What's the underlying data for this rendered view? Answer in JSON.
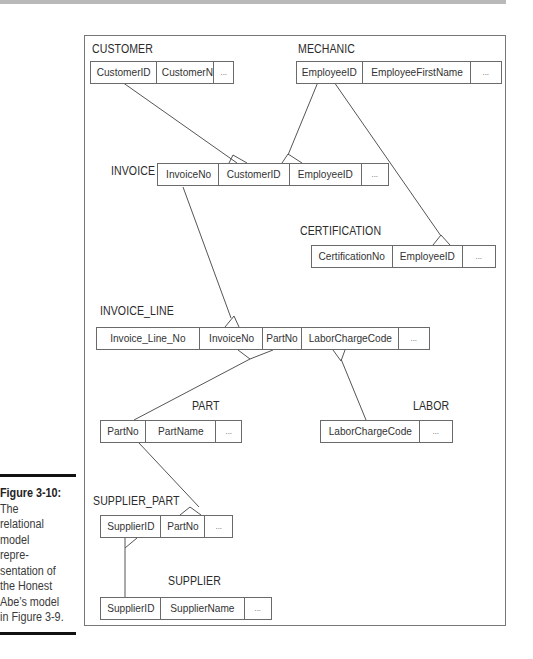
{
  "diagram": {
    "type": "relational-model",
    "tables": [
      {
        "name": "CUSTOMER",
        "columns": [
          "CustomerID",
          "CustomerName",
          "..."
        ]
      },
      {
        "name": "MECHANIC",
        "columns": [
          "EmployeeID",
          "EmployeeFirstName",
          "..."
        ]
      },
      {
        "name": "INVOICE",
        "columns": [
          "InvoiceNo",
          "CustomerID",
          "EmployeeID",
          "..."
        ]
      },
      {
        "name": "CERTIFICATION",
        "columns": [
          "CertificationNo",
          "EmployeeID",
          "..."
        ]
      },
      {
        "name": "INVOICE_LINE",
        "columns": [
          "Invoice_Line_No",
          "InvoiceNo",
          "PartNo",
          "LaborChargeCode",
          "..."
        ]
      },
      {
        "name": "PART",
        "columns": [
          "PartNo",
          "PartName",
          "..."
        ]
      },
      {
        "name": "LABOR",
        "columns": [
          "LaborChargeCode",
          "..."
        ]
      },
      {
        "name": "SUPPLIER_PART",
        "columns": [
          "SupplierID",
          "PartNo",
          "..."
        ]
      },
      {
        "name": "SUPPLIER",
        "columns": [
          "SupplierID",
          "SupplierName",
          "..."
        ]
      }
    ],
    "relationships": [
      {
        "from": "CUSTOMER.CustomerID",
        "to": "INVOICE.CustomerID",
        "cardinality": "one-to-many"
      },
      {
        "from": "MECHANIC.EmployeeID",
        "to": "INVOICE.EmployeeID",
        "cardinality": "one-to-many"
      },
      {
        "from": "MECHANIC.EmployeeID",
        "to": "CERTIFICATION.EmployeeID",
        "cardinality": "one-to-many"
      },
      {
        "from": "INVOICE.InvoiceNo",
        "to": "INVOICE_LINE.InvoiceNo",
        "cardinality": "one-to-many"
      },
      {
        "from": "PART.PartNo",
        "to": "INVOICE_LINE.PartNo",
        "cardinality": "one-to-many"
      },
      {
        "from": "LABOR.LaborChargeCode",
        "to": "INVOICE_LINE.LaborChargeCode",
        "cardinality": "one-to-many"
      },
      {
        "from": "PART.PartNo",
        "to": "SUPPLIER_PART.PartNo",
        "cardinality": "one-to-many"
      },
      {
        "from": "SUPPLIER.SupplierID",
        "to": "SUPPLIER_PART.SupplierID",
        "cardinality": "one-to-many"
      }
    ]
  },
  "caption": {
    "figure_label": "Figure 3-10:",
    "lines": [
      "The",
      "relational",
      "model",
      "repre-",
      "sentation of",
      "the Honest",
      "Abe’s model",
      "in Figure 3-9."
    ]
  }
}
